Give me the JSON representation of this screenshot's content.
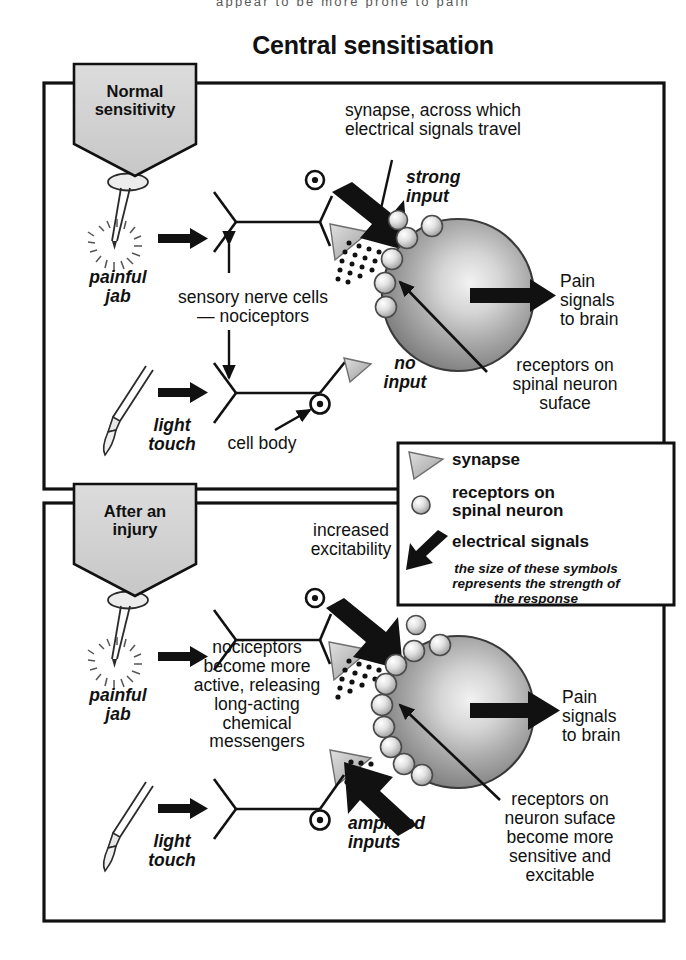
{
  "page": {
    "title": "Central sensitisation",
    "top_text_fragment": "appear to be more prone to pain",
    "colors": {
      "ink": "#111111",
      "banner_fill": "#d2d2d2",
      "neuron_gray": "#9a9a9a",
      "synapse_gray": "#b5b5b5",
      "receptor_gray": "#d8d8d8",
      "frame": "#111111"
    }
  },
  "panels": [
    {
      "id": "normal",
      "banner": "Normal\nsensitivity",
      "banner_line1": "Normal",
      "banner_line2": "sensitivity",
      "labels": {
        "synapse_note": "synapse, across which\nelectrical signals travel",
        "synapse_note_l1": "synapse, across which",
        "synapse_note_l2": "electrical signals travel",
        "strong_input_l1": "strong",
        "strong_input_l2": "input",
        "painful_jab_l1": "painful",
        "painful_jab_l2": "jab",
        "nerve_cells_l1": "sensory nerve cells",
        "nerve_cells_l2": "— nociceptors",
        "light_touch_l1": "light",
        "light_touch_l2": "touch",
        "no_input_l1": "no",
        "no_input_l2": "input",
        "cell_body": "cell body",
        "pain_signals_l1": "Pain",
        "pain_signals_l2": "signals",
        "pain_signals_l3": "to brain",
        "receptors_l1": "receptors on",
        "receptors_l2": "spinal neuron",
        "receptors_l3": "suface"
      }
    },
    {
      "id": "injury",
      "banner": "After an\ninjury",
      "banner_line1": "After an",
      "banner_line2": "injury",
      "labels": {
        "increased_l1": "increased",
        "increased_l2": "excitability",
        "painful_jab_l1": "painful",
        "painful_jab_l2": "jab",
        "center_l1": "nociceptors",
        "center_l2": "become more",
        "center_l3": "active, releasing",
        "center_l4": "long-acting",
        "center_l5": "chemical",
        "center_l6": "messengers",
        "light_touch_l1": "light",
        "light_touch_l2": "touch",
        "amplified_l1": "amplified",
        "amplified_l2": "inputs",
        "pain_signals_l1": "Pain",
        "pain_signals_l2": "signals",
        "pain_signals_l3": "to brain",
        "receptors_l1": "receptors on",
        "receptors_l2": "neuron suface",
        "receptors_l3": "become more",
        "receptors_l4": "sensitive and",
        "receptors_l5": "excitable"
      }
    }
  ],
  "legend": {
    "items": [
      {
        "icon": "synapse-triangle-icon",
        "label": "synapse"
      },
      {
        "icon": "receptor-circle-icon",
        "label_l1": "receptors on",
        "label_l2": "spinal neuron"
      },
      {
        "icon": "electrical-signal-arrow-icon",
        "label": "electrical signals"
      }
    ],
    "caption_l1": "the size of these symbols",
    "caption_l2": "represents the strength of",
    "caption_l3": "the response"
  }
}
